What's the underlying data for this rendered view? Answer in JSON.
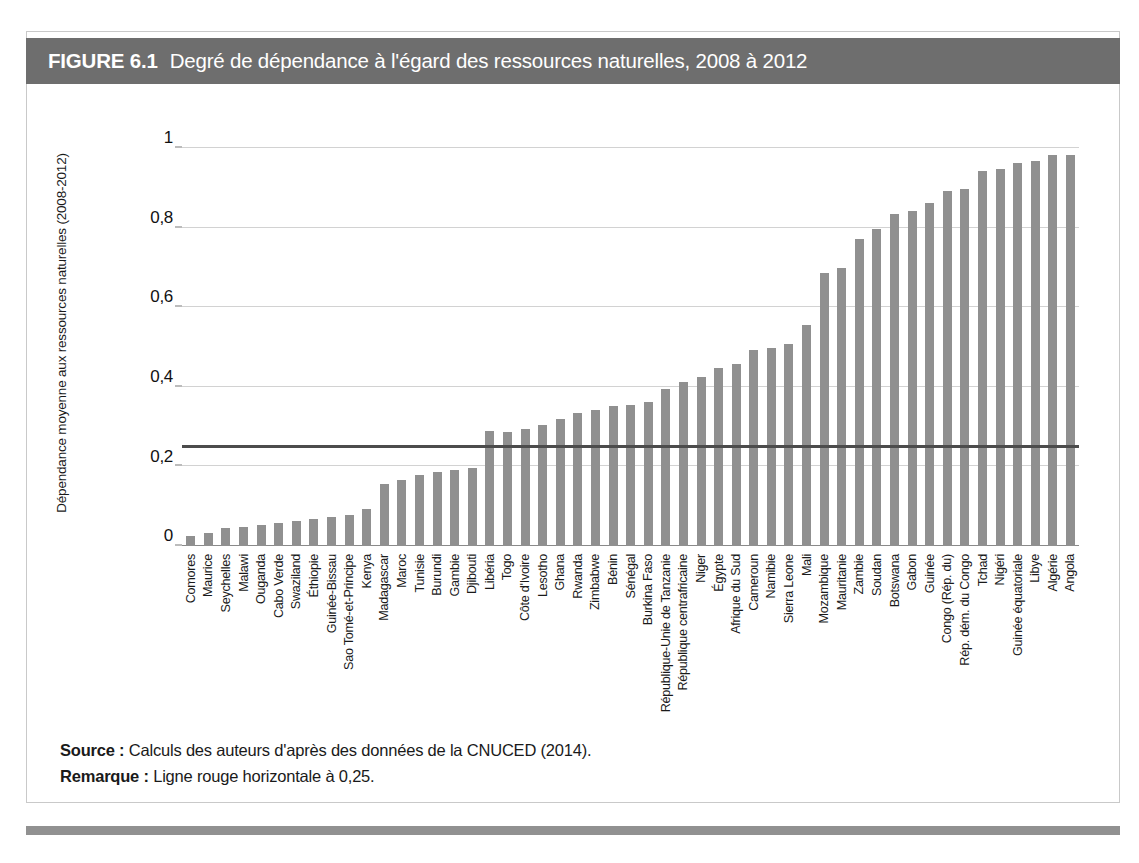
{
  "figure": {
    "number": "FIGURE 6.1",
    "title": "Degré de dépendance à l'égard des ressources naturelles, 2008 à 2012",
    "header_bg": "#6e6e6e",
    "header_text_color": "#ffffff"
  },
  "notes": {
    "source_label": "Source :",
    "source_text": "Calculs des auteurs d'après des données de la CNUCED (2014).",
    "remark_label": "Remarque :",
    "remark_text": "Ligne rouge horizontale à 0,25."
  },
  "chart_data": {
    "type": "bar",
    "title": "Degré de dépendance à l'égard des ressources naturelles, 2008 à 2012",
    "xlabel": "",
    "ylabel": "Dépendance moyenne aux ressources naturelles (2008-2012)",
    "ylim": [
      0,
      1
    ],
    "yticks": [
      0,
      0.2,
      0.4,
      0.6,
      0.8,
      1
    ],
    "ytick_labels": [
      "0",
      "0,2",
      "0,4",
      "0,6",
      "0,8",
      "1"
    ],
    "grid": true,
    "legend": "none",
    "bar_color": "#909090",
    "reference_line": {
      "value": 0.25,
      "label": "Ligne rouge horizontale à 0,25",
      "color": "#4c4c4c",
      "orientation": "horizontal"
    },
    "categories": [
      "Comores",
      "Maurice",
      "Seychelles",
      "Malawi",
      "Ouganda",
      "Cabo Verde",
      "Swaziland",
      "Éthiopie",
      "Guinée-Bissau",
      "Sao Tomé-et-Principe",
      "Kenya",
      "Madagascar",
      "Maroc",
      "Tunisie",
      "Burundi",
      "Gambie",
      "Djibouti",
      "Libéria",
      "Togo",
      "Côte d'Ivoire",
      "Lesotho",
      "Ghana",
      "Rwanda",
      "Zimbabwe",
      "Bénin",
      "Sénégal",
      "Burkina Faso",
      "République-Unie de Tanzanie",
      "République centrafricaine",
      "Niger",
      "Égypte",
      "Afrique du Sud",
      "Cameroun",
      "Namibie",
      "Sierra Leone",
      "Mali",
      "Mozambique",
      "Mauritanie",
      "Zambie",
      "Soudan",
      "Botswana",
      "Gabon",
      "Guinée",
      "Congo (Rép. du)",
      "Rép. dém. du Congo",
      "Tchad",
      "Nigéri",
      "Guinée équatoriale",
      "Libye",
      "Algérie",
      "Angola"
    ],
    "values": [
      0.026,
      0.033,
      0.046,
      0.048,
      0.052,
      0.058,
      0.062,
      0.068,
      0.072,
      0.078,
      0.092,
      0.155,
      0.165,
      0.178,
      0.185,
      0.192,
      0.196,
      0.29,
      0.287,
      0.295,
      0.305,
      0.318,
      0.335,
      0.342,
      0.352,
      0.355,
      0.363,
      0.395,
      0.412,
      0.425,
      0.448,
      0.458,
      0.492,
      0.497,
      0.508,
      0.556,
      0.685,
      0.698,
      0.772,
      0.797,
      0.833,
      0.841,
      0.862,
      0.893,
      0.898,
      0.942,
      0.948,
      0.962,
      0.968,
      0.982,
      0.982
    ]
  }
}
